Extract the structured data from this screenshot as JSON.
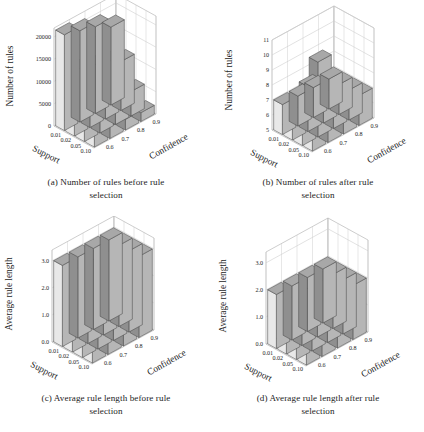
{
  "figure": {
    "panels": [
      {
        "id": "a",
        "caption_line1": "(a) Number of rules before rule",
        "caption_line2": "selection",
        "zlabel": "Number of rules",
        "xlabel": "Support",
        "ylabel": "Confidence",
        "zticks": [
          "0",
          "5000",
          "10000",
          "15000",
          "20000"
        ],
        "xticks": [
          "0.01",
          "0.02",
          "0.05",
          "0.10"
        ],
        "yticks": [
          "0.6",
          "0.7",
          "0.8",
          "0.9"
        ]
      },
      {
        "id": "b",
        "caption_line1": "(b) Number of rules after rule",
        "caption_line2": "selection",
        "zlabel": "Number of rules",
        "xlabel": "Support",
        "ylabel": "Confidence",
        "zticks": [
          "5",
          "6",
          "7",
          "8",
          "9",
          "10",
          "11"
        ],
        "xticks": [
          "0.01",
          "0.02",
          "0.05",
          "0.10"
        ],
        "yticks": [
          "0.6",
          "0.7",
          "0.8",
          "0.9"
        ]
      },
      {
        "id": "c",
        "caption_line1": "(c) Average rule length before rule",
        "caption_line2": "selection",
        "zlabel": "Average rule length",
        "xlabel": "Support",
        "ylabel": "Confidence",
        "zticks": [
          "0.0",
          "1.0",
          "2.0",
          "3.0"
        ],
        "xticks": [
          "0.01",
          "0.02",
          "0.05",
          "0.10"
        ],
        "yticks": [
          "0.6",
          "0.7",
          "0.8",
          "0.9"
        ]
      },
      {
        "id": "d",
        "caption_line1": "(d) Average rule length after rule",
        "caption_line2": "selection",
        "zlabel": "Average rule length",
        "xlabel": "Support",
        "ylabel": "Confidence",
        "zticks": [
          "0.0",
          "1.0",
          "2.0",
          "3.0"
        ],
        "xticks": [
          "0.01",
          "0.02",
          "0.05",
          "0.10"
        ],
        "yticks": [
          "0.6",
          "0.7",
          "0.8",
          "0.9"
        ]
      }
    ]
  },
  "chart_data": [
    {
      "type": "bar",
      "id": "a",
      "title": "(a) Number of rules before rule selection",
      "projection": "3d",
      "xlabel": "Support",
      "ylabel": "Confidence",
      "zlabel": "Number of rules",
      "x": [
        "0.01",
        "0.02",
        "0.05",
        "0.10"
      ],
      "y": [
        "0.6",
        "0.7",
        "0.8",
        "0.9"
      ],
      "zlim": [
        0,
        22000
      ],
      "zticks": [
        0,
        5000,
        10000,
        15000,
        20000
      ],
      "grid": true,
      "legend": "none",
      "note": "values[support_index][confidence_index]",
      "values": [
        [
          21500,
          20500,
          19500,
          17500
        ],
        [
          14500,
          13500,
          12500,
          11000
        ],
        [
          7500,
          7000,
          6500,
          5500
        ],
        [
          3000,
          2700,
          2400,
          2000
        ]
      ]
    },
    {
      "type": "bar",
      "id": "b",
      "title": "(b) Number of rules after rule selection",
      "projection": "3d",
      "xlabel": "Support",
      "ylabel": "Confidence",
      "zlabel": "Number of rules",
      "x": [
        "0.01",
        "0.02",
        "0.05",
        "0.10"
      ],
      "y": [
        "0.6",
        "0.7",
        "0.8",
        "0.9"
      ],
      "zlim": [
        5,
        11
      ],
      "zticks": [
        5,
        6,
        7,
        8,
        9,
        10,
        11
      ],
      "grid": true,
      "legend": "none",
      "note": "values[support_index][confidence_index]",
      "values": [
        [
          7,
          7,
          7,
          7
        ],
        [
          7,
          8,
          7,
          7
        ],
        [
          7,
          10,
          8,
          7
        ],
        [
          7,
          7,
          7,
          7
        ]
      ]
    },
    {
      "type": "bar",
      "id": "c",
      "title": "(c) Average rule length before rule selection",
      "projection": "3d",
      "xlabel": "Support",
      "ylabel": "Confidence",
      "zlabel": "Average rule length",
      "x": [
        "0.01",
        "0.02",
        "0.05",
        "0.10"
      ],
      "y": [
        "0.6",
        "0.7",
        "0.8",
        "0.9"
      ],
      "zlim": [
        0.0,
        3.4
      ],
      "zticks": [
        0.0,
        1.0,
        2.0,
        3.0
      ],
      "grid": true,
      "legend": "none",
      "note": "values[support_index][confidence_index]",
      "values": [
        [
          3.0,
          3.0,
          3.0,
          3.0
        ],
        [
          3.0,
          3.0,
          3.0,
          3.0
        ],
        [
          3.0,
          3.0,
          3.0,
          3.0
        ],
        [
          3.0,
          3.0,
          3.0,
          3.0
        ]
      ]
    },
    {
      "type": "bar",
      "id": "d",
      "title": "(d) Average rule length after rule selection",
      "projection": "3d",
      "xlabel": "Support",
      "ylabel": "Confidence",
      "zlabel": "Average rule length",
      "x": [
        "0.01",
        "0.02",
        "0.05",
        "0.10"
      ],
      "y": [
        "0.6",
        "0.7",
        "0.8",
        "0.9"
      ],
      "zlim": [
        0.0,
        3.4
      ],
      "zticks": [
        0.0,
        1.0,
        2.0,
        3.0
      ],
      "grid": true,
      "legend": "none",
      "note": "values[support_index][confidence_index]",
      "values": [
        [
          2.0,
          2.0,
          2.0,
          2.0
        ],
        [
          2.0,
          2.0,
          2.0,
          2.0
        ],
        [
          2.0,
          2.1,
          2.0,
          2.0
        ],
        [
          2.0,
          2.0,
          2.0,
          2.0
        ]
      ]
    }
  ],
  "colors": {
    "background": "#ffffff",
    "bar_top": "#a8a8a8",
    "bar_left_light": "#e8e8e8",
    "bar_left_dark": "#8f8f8f",
    "bar_front": "#b6b6b6",
    "edge": "#4a4a4a",
    "grid": "#cfcfcf",
    "axis": "#9a9a9a",
    "text": "#1d1d1d"
  }
}
